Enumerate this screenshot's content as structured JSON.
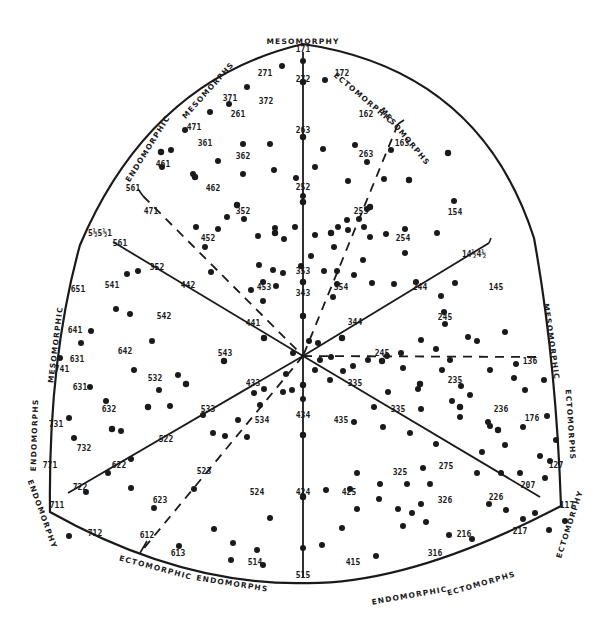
{
  "diagram": {
    "colors": {
      "ink": "#1a1a1a",
      "background": "#ffffff"
    },
    "vertex_labels": {
      "top": "MESOMORPHY",
      "bottom_left": "ENDOMORPHY",
      "bottom_right": "ECTOMORPHY"
    },
    "region_labels": [
      {
        "id": "endomorphic-mesomorphs-1",
        "text": "ENDOMORPHIC",
        "x": 150,
        "y": 150,
        "rot": -58
      },
      {
        "id": "endomorphic-mesomorphs-2",
        "text": "MESOMORPHS",
        "x": 210,
        "y": 92,
        "rot": -48
      },
      {
        "id": "ectomorphic-mesomorphs-1",
        "text": "ECTOMORPHIC",
        "x": 362,
        "y": 100,
        "rot": 40
      },
      {
        "id": "ectomorphic-mesomorphs-2",
        "text": "MESOMORPHS",
        "x": 403,
        "y": 138,
        "rot": 50
      },
      {
        "id": "mesomorphic-endomorphs-1",
        "text": "MESOMORPHIC",
        "x": 58,
        "y": 345,
        "rot": -83
      },
      {
        "id": "mesomorphic-endomorphs-2",
        "text": "ENDOMORPHS",
        "x": 37,
        "y": 435,
        "rot": -88
      },
      {
        "id": "mesomorphic-ectomorphs-1",
        "text": "MESOMORPHIC",
        "x": 549,
        "y": 342,
        "rot": 82
      },
      {
        "id": "mesomorphic-ectomorphs-2",
        "text": "ECTOMORPHS",
        "x": 568,
        "y": 425,
        "rot": 86
      },
      {
        "id": "ectomorphic-endomorphs-1",
        "text": "ECTOMORPHIC",
        "x": 155,
        "y": 570,
        "rot": 15
      },
      {
        "id": "ectomorphic-endomorphs-2",
        "text": "ENDOMORPHS",
        "x": 232,
        "y": 586,
        "rot": 9
      },
      {
        "id": "endomorphic-ectomorphs-1",
        "text": "ENDOMORPHIC",
        "x": 410,
        "y": 598,
        "rot": -10
      },
      {
        "id": "endomorphic-ectomorphs-2",
        "text": "ECTOMORPHS",
        "x": 482,
        "y": 586,
        "rot": -16
      }
    ],
    "vertex_label_positions": {
      "top": {
        "x": 303,
        "y": 44,
        "rot": 0
      },
      "bottom_left": {
        "x": 40,
        "y": 515,
        "rot": 70
      },
      "bottom_right": {
        "x": 572,
        "y": 525,
        "rot": -72
      }
    },
    "somatotype_labels": [
      {
        "t": "171",
        "x": 303,
        "y": 52
      },
      {
        "t": "272",
        "x": 303,
        "y": 82
      },
      {
        "t": "271",
        "x": 265,
        "y": 76
      },
      {
        "t": "172",
        "x": 342,
        "y": 76
      },
      {
        "t": "371",
        "x": 230,
        "y": 101
      },
      {
        "t": "372",
        "x": 266,
        "y": 104
      },
      {
        "t": "261",
        "x": 238,
        "y": 117
      },
      {
        "t": "471",
        "x": 194,
        "y": 130
      },
      {
        "t": "362",
        "x": 243,
        "y": 159
      },
      {
        "t": "361",
        "x": 205,
        "y": 146
      },
      {
        "t": "461",
        "x": 163,
        "y": 167
      },
      {
        "t": "162",
        "x": 366,
        "y": 117
      },
      {
        "t": "163",
        "x": 402,
        "y": 146
      },
      {
        "t": "263",
        "x": 303,
        "y": 133
      },
      {
        "t": "263",
        "x": 366,
        "y": 157
      },
      {
        "t": "462",
        "x": 213,
        "y": 191
      },
      {
        "t": "252",
        "x": 303,
        "y": 190
      },
      {
        "t": "561",
        "x": 133,
        "y": 191
      },
      {
        "t": "471",
        "x": 151,
        "y": 214
      },
      {
        "t": "352",
        "x": 243,
        "y": 214
      },
      {
        "t": "253",
        "x": 361,
        "y": 214
      },
      {
        "t": "154",
        "x": 455,
        "y": 215
      },
      {
        "t": "5½5½1",
        "x": 100,
        "y": 236
      },
      {
        "t": "452",
        "x": 208,
        "y": 241
      },
      {
        "t": "254",
        "x": 403,
        "y": 241
      },
      {
        "t": "561",
        "x": 120,
        "y": 246
      },
      {
        "t": "352",
        "x": 157,
        "y": 270
      },
      {
        "t": "442",
        "x": 188,
        "y": 288
      },
      {
        "t": "353",
        "x": 303,
        "y": 274
      },
      {
        "t": "14½4½",
        "x": 474,
        "y": 257
      },
      {
        "t": "651",
        "x": 78,
        "y": 292
      },
      {
        "t": "541",
        "x": 112,
        "y": 288
      },
      {
        "t": "453",
        "x": 264,
        "y": 290
      },
      {
        "t": "354",
        "x": 341,
        "y": 290
      },
      {
        "t": "343",
        "x": 303,
        "y": 296
      },
      {
        "t": "244",
        "x": 420,
        "y": 290
      },
      {
        "t": "145",
        "x": 496,
        "y": 290
      },
      {
        "t": "542",
        "x": 164,
        "y": 319
      },
      {
        "t": "245",
        "x": 445,
        "y": 320
      },
      {
        "t": "641",
        "x": 75,
        "y": 333
      },
      {
        "t": "344",
        "x": 355,
        "y": 325
      },
      {
        "t": "441",
        "x": 253,
        "y": 326
      },
      {
        "t": "631",
        "x": 77,
        "y": 362
      },
      {
        "t": "642",
        "x": 125,
        "y": 354
      },
      {
        "t": "543",
        "x": 225,
        "y": 356
      },
      {
        "t": "245",
        "x": 382,
        "y": 356
      },
      {
        "t": "136",
        "x": 530,
        "y": 364
      },
      {
        "t": "741",
        "x": 62,
        "y": 372
      },
      {
        "t": "532",
        "x": 155,
        "y": 381
      },
      {
        "t": "433",
        "x": 253,
        "y": 386
      },
      {
        "t": "335",
        "x": 355,
        "y": 386
      },
      {
        "t": "235",
        "x": 455,
        "y": 383
      },
      {
        "t": "631",
        "x": 80,
        "y": 390
      },
      {
        "t": "632",
        "x": 109,
        "y": 412
      },
      {
        "t": "533",
        "x": 208,
        "y": 412
      },
      {
        "t": "534",
        "x": 262,
        "y": 423
      },
      {
        "t": "434",
        "x": 303,
        "y": 418
      },
      {
        "t": "335",
        "x": 398,
        "y": 412
      },
      {
        "t": "435",
        "x": 341,
        "y": 423
      },
      {
        "t": "236",
        "x": 501,
        "y": 412
      },
      {
        "t": "176",
        "x": 532,
        "y": 421
      },
      {
        "t": "731",
        "x": 56,
        "y": 427
      },
      {
        "t": "732",
        "x": 84,
        "y": 451
      },
      {
        "t": "522",
        "x": 166,
        "y": 442
      },
      {
        "t": "622",
        "x": 119,
        "y": 468
      },
      {
        "t": "523",
        "x": 204,
        "y": 474
      },
      {
        "t": "325",
        "x": 400,
        "y": 475
      },
      {
        "t": "275",
        "x": 446,
        "y": 469
      },
      {
        "t": "771",
        "x": 50,
        "y": 468
      },
      {
        "t": "722",
        "x": 80,
        "y": 490
      },
      {
        "t": "326",
        "x": 445,
        "y": 503
      },
      {
        "t": "226",
        "x": 496,
        "y": 500
      },
      {
        "t": "127",
        "x": 556,
        "y": 468
      },
      {
        "t": "207",
        "x": 528,
        "y": 488
      },
      {
        "t": "711",
        "x": 57,
        "y": 508
      },
      {
        "t": "623",
        "x": 160,
        "y": 503
      },
      {
        "t": "524",
        "x": 257,
        "y": 495
      },
      {
        "t": "424",
        "x": 303,
        "y": 495
      },
      {
        "t": "425",
        "x": 349,
        "y": 495
      },
      {
        "t": "117",
        "x": 567,
        "y": 508
      },
      {
        "t": "712",
        "x": 95,
        "y": 536
      },
      {
        "t": "612",
        "x": 147,
        "y": 538
      },
      {
        "t": "613",
        "x": 178,
        "y": 556
      },
      {
        "t": "216",
        "x": 464,
        "y": 537
      },
      {
        "t": "217",
        "x": 520,
        "y": 534
      },
      {
        "t": "514",
        "x": 255,
        "y": 565
      },
      {
        "t": "415",
        "x": 353,
        "y": 565
      },
      {
        "t": "316",
        "x": 435,
        "y": 556
      },
      {
        "t": "515",
        "x": 303,
        "y": 578
      }
    ],
    "data_points": [
      [
        303,
        61
      ],
      [
        282,
        66
      ],
      [
        325,
        80
      ],
      [
        247,
        87
      ],
      [
        229,
        104
      ],
      [
        210,
        112
      ],
      [
        185,
        130
      ],
      [
        171,
        150
      ],
      [
        162,
        167
      ],
      [
        270,
        144
      ],
      [
        243,
        144
      ],
      [
        218,
        161
      ],
      [
        193,
        174
      ],
      [
        243,
        174
      ],
      [
        274,
        170
      ],
      [
        315,
        167
      ],
      [
        296,
        178
      ],
      [
        303,
        196
      ],
      [
        355,
        145
      ],
      [
        323,
        149
      ],
      [
        367,
        162
      ],
      [
        348,
        181
      ],
      [
        384,
        179
      ],
      [
        391,
        150
      ],
      [
        454,
        201
      ],
      [
        437,
        233
      ],
      [
        405,
        229
      ],
      [
        405,
        253
      ],
      [
        348,
        230
      ],
      [
        367,
        209
      ],
      [
        359,
        219
      ],
      [
        347,
        220
      ],
      [
        364,
        227
      ],
      [
        370,
        237
      ],
      [
        386,
        234
      ],
      [
        196,
        227
      ],
      [
        218,
        229
      ],
      [
        227,
        217
      ],
      [
        244,
        219
      ],
      [
        211,
        272
      ],
      [
        205,
        247
      ],
      [
        258,
        236
      ],
      [
        275,
        228
      ],
      [
        295,
        227
      ],
      [
        284,
        239
      ],
      [
        315,
        235
      ],
      [
        338,
        227
      ],
      [
        334,
        247
      ],
      [
        311,
        256
      ],
      [
        301,
        266
      ],
      [
        283,
        273
      ],
      [
        273,
        270
      ],
      [
        259,
        265
      ],
      [
        263,
        282
      ],
      [
        276,
        286
      ],
      [
        251,
        290
      ],
      [
        263,
        301
      ],
      [
        324,
        271
      ],
      [
        337,
        271
      ],
      [
        337,
        284
      ],
      [
        333,
        297
      ],
      [
        354,
        275
      ],
      [
        363,
        260
      ],
      [
        372,
        283
      ],
      [
        394,
        284
      ],
      [
        416,
        282
      ],
      [
        455,
        283
      ],
      [
        441,
        296
      ],
      [
        444,
        312
      ],
      [
        445,
        324
      ],
      [
        477,
        341
      ],
      [
        505,
        332
      ],
      [
        516,
        364
      ],
      [
        514,
        378
      ],
      [
        468,
        337
      ],
      [
        490,
        370
      ],
      [
        461,
        386
      ],
      [
        436,
        349
      ],
      [
        421,
        340
      ],
      [
        450,
        360
      ],
      [
        401,
        353
      ],
      [
        403,
        368
      ],
      [
        368,
        360
      ],
      [
        387,
        356
      ],
      [
        353,
        366
      ],
      [
        343,
        371
      ],
      [
        330,
        380
      ],
      [
        331,
        357
      ],
      [
        309,
        341
      ],
      [
        318,
        343
      ],
      [
        320,
        360
      ],
      [
        315,
        370
      ],
      [
        303,
        399
      ],
      [
        293,
        353
      ],
      [
        286,
        374
      ],
      [
        292,
        390
      ],
      [
        283,
        392
      ],
      [
        264,
        389
      ],
      [
        254,
        393
      ],
      [
        260,
        405
      ],
      [
        238,
        420
      ],
      [
        247,
        437
      ],
      [
        225,
        436
      ],
      [
        213,
        433
      ],
      [
        203,
        415
      ],
      [
        170,
        406
      ],
      [
        159,
        390
      ],
      [
        178,
        375
      ],
      [
        134,
        370
      ],
      [
        152,
        341
      ],
      [
        130,
        314
      ],
      [
        116,
        309
      ],
      [
        127,
        274
      ],
      [
        138,
        271
      ],
      [
        91,
        331
      ],
      [
        81,
        343
      ],
      [
        60,
        358
      ],
      [
        90,
        387
      ],
      [
        106,
        401
      ],
      [
        69,
        418
      ],
      [
        74,
        438
      ],
      [
        121,
        431
      ],
      [
        131,
        459
      ],
      [
        108,
        473
      ],
      [
        131,
        488
      ],
      [
        86,
        492
      ],
      [
        69,
        536
      ],
      [
        194,
        489
      ],
      [
        154,
        508
      ],
      [
        179,
        546
      ],
      [
        214,
        529
      ],
      [
        233,
        543
      ],
      [
        270,
        518
      ],
      [
        303,
        496
      ],
      [
        326,
        490
      ],
      [
        350,
        489
      ],
      [
        357,
        509
      ],
      [
        380,
        484
      ],
      [
        407,
        484
      ],
      [
        430,
        484
      ],
      [
        403,
        526
      ],
      [
        376,
        556
      ],
      [
        342,
        528
      ],
      [
        322,
        545
      ],
      [
        257,
        550
      ],
      [
        231,
        560
      ],
      [
        263,
        565
      ],
      [
        303,
        548
      ],
      [
        482,
        452
      ],
      [
        477,
        473
      ],
      [
        501,
        473
      ],
      [
        520,
        473
      ],
      [
        540,
        456
      ],
      [
        550,
        461
      ],
      [
        545,
        478
      ],
      [
        535,
        513
      ],
      [
        549,
        530
      ],
      [
        565,
        521
      ],
      [
        523,
        519
      ],
      [
        506,
        510
      ],
      [
        489,
        504
      ],
      [
        472,
        539
      ],
      [
        449,
        535
      ],
      [
        426,
        522
      ],
      [
        421,
        504
      ],
      [
        412,
        513
      ],
      [
        398,
        509
      ],
      [
        379,
        499
      ],
      [
        357,
        473
      ],
      [
        423,
        468
      ],
      [
        436,
        444
      ],
      [
        410,
        433
      ],
      [
        383,
        427
      ],
      [
        354,
        422
      ],
      [
        374,
        407
      ],
      [
        388,
        392
      ],
      [
        421,
        409
      ],
      [
        460,
        417
      ],
      [
        452,
        401
      ],
      [
        418,
        389
      ],
      [
        442,
        370
      ],
      [
        470,
        395
      ],
      [
        490,
        426
      ],
      [
        544,
        380
      ],
      [
        525,
        390
      ],
      [
        547,
        416
      ],
      [
        556,
        440
      ],
      [
        523,
        427
      ],
      [
        505,
        445
      ],
      [
        488,
        422
      ]
    ],
    "axis_ticks": [
      [
        303,
        82
      ],
      [
        303,
        137
      ],
      [
        303,
        202
      ],
      [
        303,
        282
      ],
      [
        303,
        316
      ],
      [
        303,
        385
      ],
      [
        303,
        435
      ],
      [
        303,
        497
      ],
      [
        275,
        233
      ],
      [
        237,
        205
      ],
      [
        195,
        177
      ],
      [
        161,
        152
      ],
      [
        331,
        233
      ],
      [
        370,
        207
      ],
      [
        409,
        180
      ],
      [
        448,
        153
      ],
      [
        264,
        338
      ],
      [
        224,
        361
      ],
      [
        186,
        384
      ],
      [
        148,
        407
      ],
      [
        112,
        429
      ],
      [
        342,
        338
      ],
      [
        382,
        361
      ],
      [
        420,
        384
      ],
      [
        460,
        407
      ],
      [
        498,
        430
      ]
    ]
  }
}
